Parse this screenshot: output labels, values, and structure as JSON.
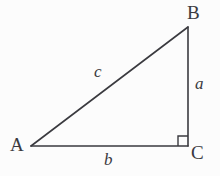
{
  "figure": {
    "name": "right-triangle",
    "background_color": "#fcfcfc",
    "stroke_color": "#3a3a3f",
    "stroke_width": 1.6
  },
  "geometry": {
    "vertices": {
      "A": {
        "x": 31,
        "y": 146
      },
      "B": {
        "x": 188,
        "y": 27
      },
      "C": {
        "x": 188,
        "y": 146
      }
    },
    "edges": [
      {
        "id": "hypotenuse",
        "from": "A",
        "to": "B",
        "label": "c"
      },
      {
        "id": "vertical-leg",
        "from": "B",
        "to": "C",
        "label": "a"
      },
      {
        "id": "horizontal-leg",
        "from": "A",
        "to": "C",
        "label": "b"
      }
    ],
    "right_angle": {
      "at": "C",
      "size": 10,
      "x": 178,
      "y": 136
    }
  },
  "labels": {
    "vertex_A": "A",
    "vertex_B": "B",
    "vertex_C": "C",
    "side_a": "a",
    "side_b": "b",
    "side_c": "c"
  },
  "chart_data": {
    "type": "diagram",
    "title": "",
    "points": [
      {
        "name": "A",
        "x": 31,
        "y": 146
      },
      {
        "name": "B",
        "x": 188,
        "y": 27
      },
      {
        "name": "C",
        "x": 188,
        "y": 146
      }
    ],
    "segments": [
      {
        "name": "c",
        "endpoints": [
          "A",
          "B"
        ],
        "role": "hypotenuse"
      },
      {
        "name": "a",
        "endpoints": [
          "B",
          "C"
        ],
        "role": "leg"
      },
      {
        "name": "b",
        "endpoints": [
          "A",
          "C"
        ],
        "role": "leg"
      }
    ],
    "angles": [
      {
        "vertex": "C",
        "value": 90,
        "marked": true
      }
    ]
  }
}
